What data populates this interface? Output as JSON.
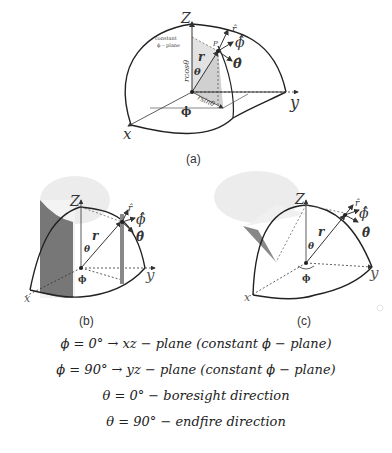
{
  "figure_a": {
    "caption": "(a)",
    "axes": {
      "x": "x",
      "y": "y",
      "z": "Z"
    },
    "labels": {
      "point": "P",
      "r_vec": "r",
      "theta": "θ",
      "phi": "ϕ",
      "r_hat": "r̂",
      "phi_hat": "ϕ̂",
      "theta_hat": "θ̂",
      "rcos": "rcosθ",
      "rsin": "rsinθ",
      "constant_line1": "constant",
      "constant_line2": "ϕ – plane"
    }
  },
  "figure_b": {
    "caption": "(b)",
    "axes": {
      "x": "x",
      "y": "y",
      "z": "Z"
    },
    "labels": {
      "r_vec": "r",
      "theta": "θ",
      "phi": "ϕ",
      "r_hat": "r̂",
      "phi_hat": "ϕ̂",
      "theta_hat": "θ̂"
    }
  },
  "figure_c": {
    "caption": "(c)",
    "axes": {
      "x": "x",
      "y": "y",
      "z": "Z"
    },
    "labels": {
      "r_vec": "r",
      "theta": "θ",
      "phi": "ϕ",
      "r_hat": "r̂",
      "phi_hat": "ϕ̂",
      "theta_hat": "θ̂"
    }
  },
  "equations": [
    "ϕ = 0° → xz − plane (constant ϕ − plane)",
    "ϕ = 90° → yz − plane (constant ϕ − plane)",
    "θ = 0° − boresight direction",
    "θ = 90° − endfire direction"
  ]
}
